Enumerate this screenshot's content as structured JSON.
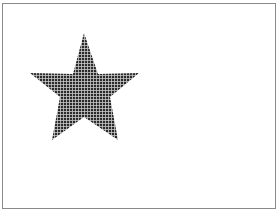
{
  "canvas": {
    "background": "#ffffff",
    "border_color": "#8a8a8a"
  },
  "shapes": [
    {
      "type": "star",
      "points": "84,33 98,74 139,73 110,97 118,140 84,117 52,140 60,97 30,73 73,74",
      "fill_pattern": "grid",
      "fill_color": "#2a2a2a",
      "grid_line_color": "#c8c8c8",
      "grid_spacing": 3
    }
  ]
}
